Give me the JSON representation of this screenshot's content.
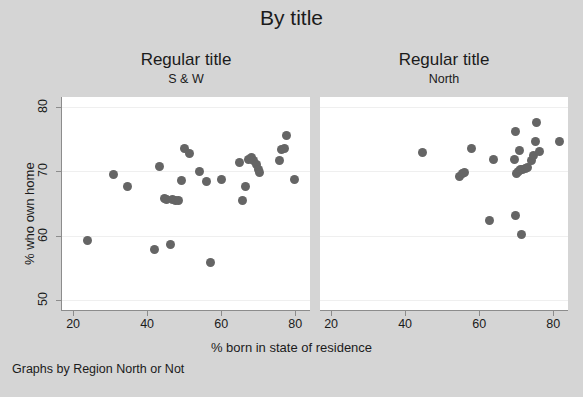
{
  "figure": {
    "title": "By title",
    "caption": "Graphs by Region North or Not",
    "background_color": "#d5d5d5",
    "plot_background_color": "#ffffff",
    "marker_color": "#656565",
    "axis_color": "#8c8c8c"
  },
  "axes": {
    "xlabel": "% born in state of residence",
    "ylabel": "% who own home",
    "xticks": [
      "20",
      "40",
      "60",
      "80"
    ],
    "yticks": [
      "50",
      "60",
      "70",
      "80"
    ]
  },
  "chart_data": {
    "type": "scatter",
    "title": "By title",
    "xlabel": "% born in state of residence",
    "ylabel": "% who own home",
    "caption": "Graphs by Region North or Not",
    "xlim": [
      17,
      84
    ],
    "ylim": [
      48.5,
      81.5
    ],
    "xticks": [
      20,
      40,
      60,
      80
    ],
    "yticks": [
      50,
      60,
      70,
      80
    ],
    "grid": "horizontal",
    "legend": "none",
    "panels": [
      {
        "title": "Regular title",
        "subtitle": "S & W",
        "points": [
          {
            "x": 23.8,
            "y": 59.2
          },
          {
            "x": 30.9,
            "y": 69.5
          },
          {
            "x": 34.6,
            "y": 67.7
          },
          {
            "x": 41.9,
            "y": 57.9
          },
          {
            "x": 43.4,
            "y": 70.8
          },
          {
            "x": 44.6,
            "y": 65.8
          },
          {
            "x": 45.2,
            "y": 65.7
          },
          {
            "x": 46.2,
            "y": 58.6
          },
          {
            "x": 46.8,
            "y": 65.6
          },
          {
            "x": 47.6,
            "y": 65.5
          },
          {
            "x": 48.5,
            "y": 65.4
          },
          {
            "x": 49.4,
            "y": 68.5
          },
          {
            "x": 50.1,
            "y": 73.5
          },
          {
            "x": 51.4,
            "y": 72.8
          },
          {
            "x": 54.1,
            "y": 70.0
          },
          {
            "x": 55.9,
            "y": 68.4
          },
          {
            "x": 57.2,
            "y": 55.8
          },
          {
            "x": 60.2,
            "y": 68.8
          },
          {
            "x": 64.9,
            "y": 71.3
          },
          {
            "x": 65.8,
            "y": 65.4
          },
          {
            "x": 66.6,
            "y": 67.7
          },
          {
            "x": 67.3,
            "y": 71.9
          },
          {
            "x": 68.2,
            "y": 72.2
          },
          {
            "x": 68.8,
            "y": 71.6
          },
          {
            "x": 69.4,
            "y": 71.0
          },
          {
            "x": 70.0,
            "y": 70.3
          },
          {
            "x": 70.4,
            "y": 69.8
          },
          {
            "x": 75.8,
            "y": 71.6
          },
          {
            "x": 76.4,
            "y": 73.4
          },
          {
            "x": 77.2,
            "y": 73.5
          },
          {
            "x": 77.6,
            "y": 75.5
          },
          {
            "x": 79.8,
            "y": 68.8
          }
        ]
      },
      {
        "title": "Regular title",
        "subtitle": "North",
        "points": [
          {
            "x": 44.8,
            "y": 72.9
          },
          {
            "x": 54.8,
            "y": 69.2
          },
          {
            "x": 55.6,
            "y": 69.6
          },
          {
            "x": 55.9,
            "y": 69.8
          },
          {
            "x": 57.8,
            "y": 73.6
          },
          {
            "x": 62.9,
            "y": 62.3
          },
          {
            "x": 63.8,
            "y": 71.9
          },
          {
            "x": 69.4,
            "y": 71.9
          },
          {
            "x": 69.7,
            "y": 76.2
          },
          {
            "x": 69.8,
            "y": 63.1
          },
          {
            "x": 70.2,
            "y": 69.6
          },
          {
            "x": 70.6,
            "y": 70.0
          },
          {
            "x": 70.9,
            "y": 73.2
          },
          {
            "x": 71.2,
            "y": 70.2
          },
          {
            "x": 71.4,
            "y": 60.2
          },
          {
            "x": 71.8,
            "y": 70.2
          },
          {
            "x": 72.4,
            "y": 70.4
          },
          {
            "x": 73.1,
            "y": 70.6
          },
          {
            "x": 74.2,
            "y": 71.6
          },
          {
            "x": 74.6,
            "y": 72.4
          },
          {
            "x": 75.1,
            "y": 74.6
          },
          {
            "x": 75.6,
            "y": 77.5
          },
          {
            "x": 76.4,
            "y": 73.0
          },
          {
            "x": 81.6,
            "y": 74.6
          }
        ]
      }
    ]
  }
}
